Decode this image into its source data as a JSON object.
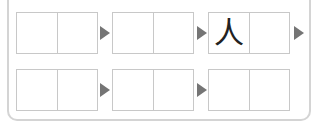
{
  "colors": {
    "border": "#c8c8c8",
    "panel_border": "#d4d4d4",
    "arrow": "#757575",
    "glyph": "#222222"
  },
  "rows": [
    {
      "pairs": [
        {
          "cells": [
            "",
            ""
          ]
        },
        {
          "cells": [
            "",
            ""
          ]
        },
        {
          "cells": [
            "人",
            ""
          ]
        }
      ],
      "arrows": 3
    },
    {
      "pairs": [
        {
          "cells": [
            "",
            ""
          ]
        },
        {
          "cells": [
            "",
            ""
          ]
        },
        {
          "cells": [
            "",
            ""
          ]
        }
      ],
      "arrows": 2
    }
  ]
}
